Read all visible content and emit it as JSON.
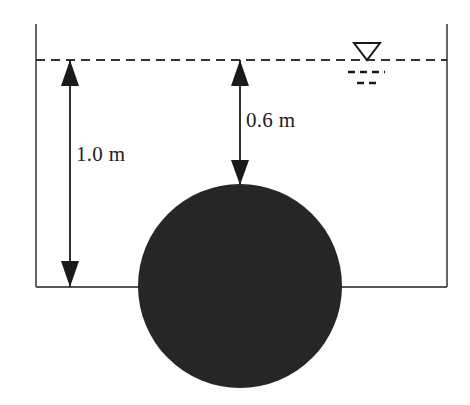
{
  "figure": {
    "type": "engineering-diagram",
    "background_color": "#ffffff",
    "width": 470,
    "height": 405
  },
  "colors": {
    "line": "#555555",
    "ink": "#1a1a1a",
    "sphere_fill": "#262626",
    "water_symbol": "#1a1a1a",
    "background": "#ffffff"
  },
  "tank": {
    "left_wall": {
      "name": "left-wall",
      "x": 36,
      "y_top": 24,
      "y_bottom": 287
    },
    "right_wall": {
      "name": "right-wall",
      "x": 447,
      "y_top": 24,
      "y_bottom": 287
    },
    "bottom_line": {
      "name": "tank-bottom",
      "y": 287,
      "x_start": 36,
      "x_end": 447
    },
    "water_surface": {
      "name": "water-surface-line",
      "y": 60,
      "x_start": 36,
      "x_end": 447,
      "style": "dashed"
    }
  },
  "water_level_symbol": {
    "triangle": {
      "cx": 367,
      "apex_y": 60,
      "half_width": 13,
      "height": 17
    },
    "dash_long": {
      "y": 72,
      "x_start": 348,
      "x_end": 385
    },
    "dash_short": {
      "y": 83,
      "x_start": 357,
      "x_end": 377
    }
  },
  "sphere": {
    "name": "submerged-sphere",
    "center_x": 240,
    "center_y": 286,
    "radius": 102,
    "fill": "#262626"
  },
  "dimensions": [
    {
      "id": "total-depth",
      "label": "1.0 m",
      "value": 1.0,
      "unit": "m",
      "measures": "water surface to tank bottom",
      "arrow_x": 70,
      "y_top": 60,
      "y_bottom": 287,
      "label_x": 76,
      "label_y": 142
    },
    {
      "id": "submergence-depth",
      "label": "0.6 m",
      "value": 0.6,
      "unit": "m",
      "measures": "water surface to top of sphere",
      "arrow_x": 240,
      "y_top": 60,
      "y_bottom": 185,
      "label_x": 246,
      "label_y": 108
    }
  ]
}
